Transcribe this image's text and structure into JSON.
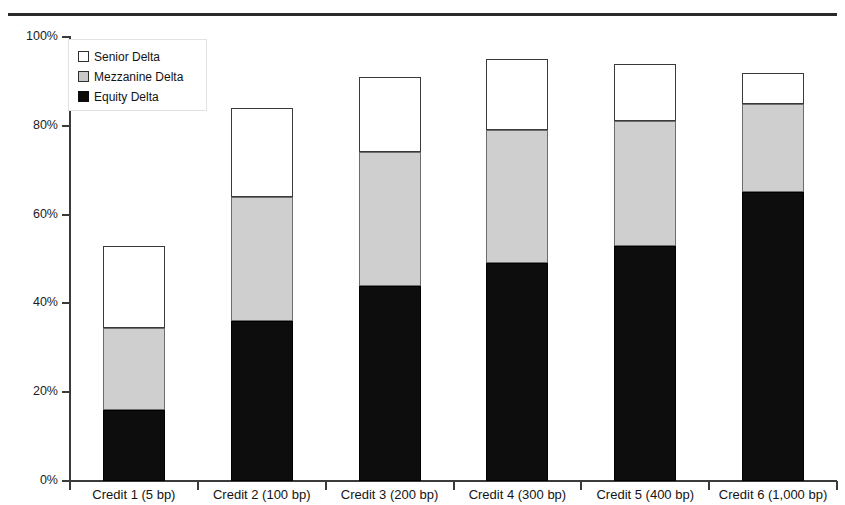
{
  "chart_data": {
    "type": "bar",
    "subtype": "stacked-vertical",
    "title": "",
    "subtitle": "",
    "xlabel": "",
    "ylabel": "",
    "ylim": [
      0,
      100
    ],
    "y_tick_labels": [
      "0%",
      "20%",
      "40%",
      "60%",
      "80%",
      "100%"
    ],
    "y_tick_values": [
      0,
      20,
      40,
      60,
      80,
      100
    ],
    "y_unit": "%",
    "grid": false,
    "legend_position": "top-left inside plot",
    "categories": [
      "Credit 1 (5 bp)",
      "Credit 2 (100 bp)",
      "Credit 3 (200 bp)",
      "Credit 4 (300 bp)",
      "Credit 5 (400 bp)",
      "Credit 6 (1,000 bp)"
    ],
    "series": [
      {
        "name": "Equity Delta",
        "color": "#0d0d0d",
        "values": [
          16,
          36,
          44,
          49,
          53,
          65
        ]
      },
      {
        "name": "Mezzanine Delta",
        "color": "#cfcfcf",
        "values": [
          18.5,
          28,
          30,
          30,
          28,
          20
        ]
      },
      {
        "name": "Senior Delta",
        "color": "#ffffff",
        "values": [
          18.5,
          20,
          17,
          16,
          13,
          7
        ]
      }
    ],
    "cumulative_tops": [
      {
        "category": "Credit 1 (5 bp)",
        "equity": 16,
        "mezzanine": 34.5,
        "total": 53
      },
      {
        "category": "Credit 2 (100 bp)",
        "equity": 36,
        "mezzanine": 64,
        "total": 84
      },
      {
        "category": "Credit 3 (200 bp)",
        "equity": 44,
        "mezzanine": 74,
        "total": 91
      },
      {
        "category": "Credit 4 (300 bp)",
        "equity": 49,
        "mezzanine": 79,
        "total": 95
      },
      {
        "category": "Credit 5 (400 bp)",
        "equity": 53,
        "mezzanine": 81,
        "total": 94
      },
      {
        "category": "Credit 6 (1,000 bp)",
        "equity": 65,
        "mezzanine": 85,
        "total": 92
      }
    ],
    "legend": [
      {
        "label": "Senior Delta",
        "swatch": "white"
      },
      {
        "label": "Mezzanine Delta",
        "swatch": "gray"
      },
      {
        "label": "Equity Delta",
        "swatch": "black"
      }
    ]
  },
  "colors": {
    "equity": "#0d0d0d",
    "mezzanine": "#cfcfcf",
    "senior": "#ffffff",
    "axis": "#3b3b3b",
    "rule": "#2a2a2a",
    "text": "#141414"
  }
}
